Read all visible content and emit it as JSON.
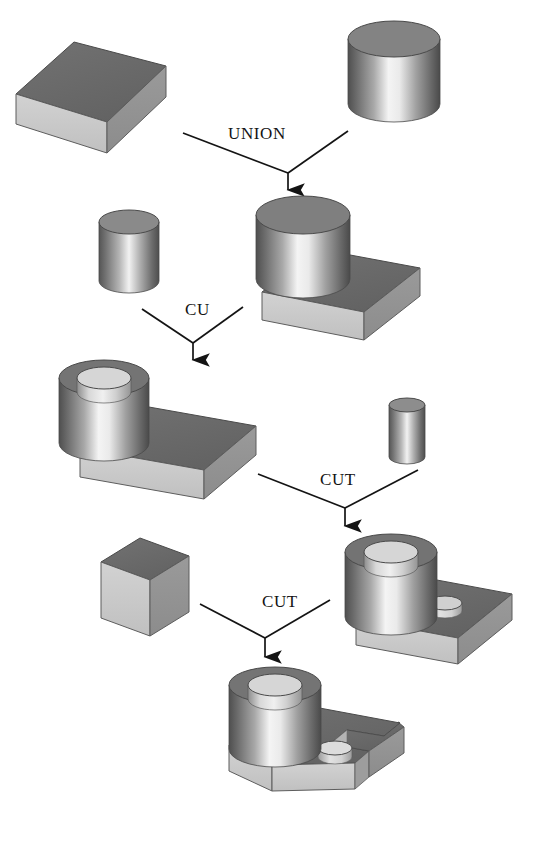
{
  "figure": {
    "top_cropped_text": "",
    "background_color": "#ffffff",
    "line_color": "#141414"
  },
  "palette": {
    "face_top_dark": "#6b6b6b",
    "face_top_mid": "#7d7d7d",
    "face_front_light": "#c9c9c9",
    "face_right_mid": "#949494",
    "face_shadow": "#8a8a8a",
    "cyl_highlight": "#f2f2f2",
    "cyl_dark": "#5a5a5a",
    "hole_inner_dark": "#707070",
    "outline": "#3a3a3a"
  },
  "operations": [
    {
      "id": "op-union",
      "label": "UNION",
      "x": 228,
      "y": 124
    },
    {
      "id": "op-cu",
      "label": "CU",
      "x": 185,
      "y": 300
    },
    {
      "id": "op-cut-1",
      "label": "CUT",
      "x": 320,
      "y": 470
    },
    {
      "id": "op-cut-2",
      "label": "CUT",
      "x": 262,
      "y": 592
    }
  ],
  "shapes": [
    {
      "id": "shape-block-base",
      "name": "rectangular-block",
      "row": 1,
      "side": "left"
    },
    {
      "id": "shape-cylinder-large",
      "name": "cylinder",
      "row": 1,
      "side": "right"
    },
    {
      "id": "shape-cylinder-medium",
      "name": "cylinder",
      "row": 2,
      "side": "left"
    },
    {
      "id": "shape-union-result",
      "name": "cylinder-on-block",
      "row": 2,
      "side": "right"
    },
    {
      "id": "shape-ring-on-block",
      "name": "hollow-cylinder-on-block",
      "row": 3,
      "side": "left"
    },
    {
      "id": "shape-cylinder-small",
      "name": "small-cylinder",
      "row": 3,
      "side": "right"
    },
    {
      "id": "shape-block-thin",
      "name": "thin-block",
      "row": 4,
      "side": "left"
    },
    {
      "id": "shape-ring-block-hole",
      "name": "ring-on-block-with-hole",
      "row": 4,
      "side": "right"
    },
    {
      "id": "shape-final-part",
      "name": "final-part-with-slot",
      "row": 5,
      "side": "center"
    }
  ],
  "arrows": [
    {
      "id": "arrow-union",
      "from_left": [
        183,
        133
      ],
      "from_right": [
        348,
        131
      ],
      "apex": [
        288,
        173
      ],
      "tip": [
        288,
        198
      ]
    },
    {
      "id": "arrow-cu",
      "from_left": [
        142,
        309
      ],
      "from_right": [
        243,
        307
      ],
      "apex": [
        193,
        343
      ],
      "tip": [
        193,
        368
      ]
    },
    {
      "id": "arrow-cut-1",
      "from_left": [
        258,
        474
      ],
      "from_right": [
        418,
        470
      ],
      "apex": [
        345,
        508
      ],
      "tip": [
        345,
        534
      ]
    },
    {
      "id": "arrow-cut-2",
      "from_left": [
        200,
        604
      ],
      "from_right": [
        330,
        600
      ],
      "apex": [
        265,
        638
      ],
      "tip": [
        265,
        665
      ]
    }
  ]
}
